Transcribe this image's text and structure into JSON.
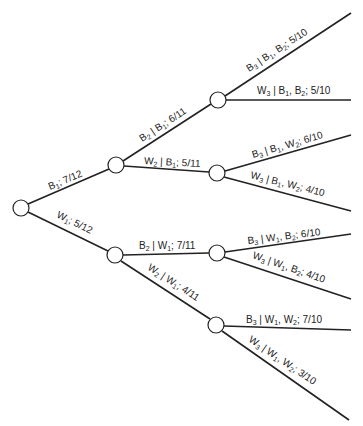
{
  "diagram": {
    "type": "probability-tree",
    "nodes": [
      {
        "id": "root",
        "x": 21,
        "y": 208
      },
      {
        "id": "B1",
        "x": 116,
        "y": 165
      },
      {
        "id": "W1",
        "x": 115,
        "y": 255
      },
      {
        "id": "B1B2",
        "x": 218,
        "y": 100
      },
      {
        "id": "B1W2",
        "x": 217,
        "y": 173
      },
      {
        "id": "W1B2",
        "x": 217,
        "y": 253
      },
      {
        "id": "W1W2",
        "x": 216,
        "y": 325
      }
    ],
    "edges": [
      {
        "from": "root",
        "to": "B1",
        "label": {
          "parts": [
            [
              "B",
              "1"
            ],
            [
              "; 7/12",
              ""
            ]
          ]
        },
        "text": "B1; 7/12"
      },
      {
        "from": "root",
        "to": "W1",
        "label": {
          "parts": [
            [
              "W",
              "1"
            ],
            [
              ";  5/12",
              ""
            ]
          ]
        },
        "text": "W1; 5/12"
      },
      {
        "from": "B1",
        "to": "B1B2",
        "text": "B2 | B1; 6/11"
      },
      {
        "from": "B1",
        "to": "B1W2",
        "text": "W2 | B1; 5/11"
      },
      {
        "from": "W1",
        "to": "W1B2",
        "text": "B2 | W1; 7/11"
      },
      {
        "from": "W1",
        "to": "W1W2",
        "text": "W2 | W1; 4/11"
      },
      {
        "from": "B1B2",
        "to": "leaf1",
        "text": "B3 | B1, B2; 5/10"
      },
      {
        "from": "B1B2",
        "to": "leaf2",
        "text": "W3 | B1, B2; 5/10"
      },
      {
        "from": "B1W2",
        "to": "leaf3",
        "text": "B3 | B1, W2; 6/10"
      },
      {
        "from": "B1W2",
        "to": "leaf4",
        "text": "W3 | B1, W2; 4/10"
      },
      {
        "from": "W1B2",
        "to": "leaf5",
        "text": "B3 | W1, B2; 6/10"
      },
      {
        "from": "W1B2",
        "to": "leaf6",
        "text": "W3 | W1, B2; 4/10"
      },
      {
        "from": "W1W2",
        "to": "leaf7",
        "text": "B3 | W1, W2; 7/10"
      },
      {
        "from": "W1W2",
        "to": "leaf8",
        "text": "W3 | W1, W2; 3/10"
      }
    ],
    "labels": {
      "e_root_B1": {
        "a": "B",
        "a_sub": "1",
        "rest": "; 7/12"
      },
      "e_root_W1": {
        "a": "W",
        "a_sub": "1",
        "rest": ";  5/12"
      },
      "e_B1_B2": {
        "a": "B",
        "a_sub": "2",
        "mid": " | B",
        "mid_sub": "1",
        "rest": ";  6/11"
      },
      "e_B1_W2": {
        "a": "W",
        "a_sub": "2",
        "mid": " | B",
        "mid_sub": "1",
        "rest": ";  5/11"
      },
      "e_W1_B2": {
        "a": "B",
        "a_sub": "2",
        "mid": " | W",
        "mid_sub": "1",
        "rest": ";  7/11"
      },
      "e_W1_W2": {
        "a": "W",
        "a_sub": "2",
        "mid": " | W",
        "mid_sub": "1",
        "rest": ";  4/11"
      },
      "l1": {
        "a": "B",
        "a_sub": "3",
        "m1": " | B",
        "m1_sub": "1",
        "m2": ",  B",
        "m2_sub": "2",
        "rest": "; 5/10"
      },
      "l2": {
        "a": "W",
        "a_sub": "3",
        "m1": " | B",
        "m1_sub": "1",
        "m2": ",  B",
        "m2_sub": "2",
        "rest": ";  5/10"
      },
      "l3": {
        "a": "B",
        "a_sub": "3",
        "m1": " | B",
        "m1_sub": "1",
        "m2": ",  W",
        "m2_sub": "2",
        "rest": "; 6/10"
      },
      "l4": {
        "a": "W",
        "a_sub": "3",
        "m1": " | B",
        "m1_sub": "1",
        "m2": ",  W",
        "m2_sub": "2",
        "rest": ";  4/10"
      },
      "l5": {
        "a": "B",
        "a_sub": "3",
        "m1": " | W",
        "m1_sub": "1",
        "m2": ",  B",
        "m2_sub": "2",
        "rest": ";  6/10"
      },
      "l6": {
        "a": "W",
        "a_sub": "3",
        "m1": " | W",
        "m1_sub": "1",
        "m2": ",  B",
        "m2_sub": "2",
        "rest": ";  4/10"
      },
      "l7": {
        "a": "B",
        "a_sub": "3",
        "m1": " | W",
        "m1_sub": "1",
        "m2": ",  W",
        "m2_sub": "2",
        "rest": ";  7/10"
      },
      "l8": {
        "a": "W",
        "a_sub": "3",
        "m1": " | W",
        "m1_sub": "1",
        "m2": ",  W",
        "m2_sub": "2",
        "rest": ";  3/10"
      }
    }
  }
}
